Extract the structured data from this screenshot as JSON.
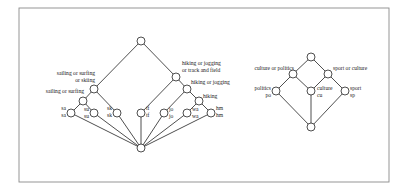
{
  "frame": {
    "x": 19,
    "y": 8,
    "w": 370,
    "h": 174,
    "border_color": "#8a8a8a"
  },
  "colors": {
    "line": "#222222",
    "node_fill": "#ffffff",
    "node_stroke": "#222222"
  },
  "node_radius": 4,
  "lattices": [
    {
      "name": "sport-lattice",
      "nodes": [
        {
          "id": "top",
          "x": 141,
          "y": 41
        },
        {
          "id": "sos-ski",
          "x": 94,
          "y": 89
        },
        {
          "id": "sos",
          "x": 83,
          "y": 101
        },
        {
          "id": "sa",
          "x": 71,
          "y": 113
        },
        {
          "id": "su",
          "x": 94,
          "y": 113
        },
        {
          "id": "sk",
          "x": 117,
          "y": 113
        },
        {
          "id": "hj-tf",
          "x": 176,
          "y": 77
        },
        {
          "id": "hj",
          "x": 187,
          "y": 89
        },
        {
          "id": "hi",
          "x": 199,
          "y": 101
        },
        {
          "id": "tf",
          "x": 141,
          "y": 113
        },
        {
          "id": "jo",
          "x": 164,
          "y": 113
        },
        {
          "id": "wa",
          "x": 187,
          "y": 113
        },
        {
          "id": "hm",
          "x": 211,
          "y": 113
        },
        {
          "id": "bottom",
          "x": 141,
          "y": 148
        }
      ],
      "edges": [
        [
          "top",
          "sos-ski"
        ],
        [
          "top",
          "hj-tf"
        ],
        [
          "sos-ski",
          "sos"
        ],
        [
          "sos-ski",
          "sk"
        ],
        [
          "sos",
          "sa"
        ],
        [
          "sos",
          "su"
        ],
        [
          "hj-tf",
          "hj"
        ],
        [
          "hj-tf",
          "tf"
        ],
        [
          "hj",
          "hi"
        ],
        [
          "hj",
          "jo"
        ],
        [
          "hi",
          "wa"
        ],
        [
          "hi",
          "hm"
        ],
        [
          "sa",
          "bottom"
        ],
        [
          "su",
          "bottom"
        ],
        [
          "sk",
          "bottom"
        ],
        [
          "tf",
          "bottom"
        ],
        [
          "jo",
          "bottom"
        ],
        [
          "wa",
          "bottom"
        ],
        [
          "hm",
          "bottom"
        ]
      ],
      "labels": [
        {
          "text": "sailing or surfing",
          "x": 95,
          "y": 75,
          "anchor": "end"
        },
        {
          "text": "or skiing",
          "x": 95,
          "y": 82,
          "anchor": "end"
        },
        {
          "text": "sailing or surfing",
          "x": 84,
          "y": 93,
          "anchor": "end"
        },
        {
          "text": "sa",
          "x": 66,
          "y": 110,
          "anchor": "end"
        },
        {
          "text": "sa",
          "x": 66,
          "y": 117,
          "anchor": "end"
        },
        {
          "text": "su",
          "x": 89,
          "y": 111,
          "anchor": "end"
        },
        {
          "text": "su",
          "x": 89,
          "y": 118,
          "anchor": "end"
        },
        {
          "text": "sk",
          "x": 112,
          "y": 110,
          "anchor": "end"
        },
        {
          "text": "sk",
          "x": 112,
          "y": 117,
          "anchor": "end"
        },
        {
          "text": "hiking or jogging",
          "x": 182,
          "y": 65,
          "anchor": "start"
        },
        {
          "text": "or track and field",
          "x": 182,
          "y": 72,
          "anchor": "start"
        },
        {
          "text": "hiking or jogging",
          "x": 191,
          "y": 84,
          "anchor": "start"
        },
        {
          "text": "hiking",
          "x": 203,
          "y": 98,
          "anchor": "start"
        },
        {
          "text": "tf",
          "x": 146,
          "y": 110,
          "anchor": "start"
        },
        {
          "text": "tf",
          "x": 146,
          "y": 117,
          "anchor": "start"
        },
        {
          "text": "jo",
          "x": 169,
          "y": 111,
          "anchor": "start"
        },
        {
          "text": "jo",
          "x": 169,
          "y": 118,
          "anchor": "start"
        },
        {
          "text": "wa",
          "x": 192,
          "y": 111,
          "anchor": "start"
        },
        {
          "text": "wa",
          "x": 192,
          "y": 118,
          "anchor": "start"
        },
        {
          "text": "hm",
          "x": 216,
          "y": 110,
          "anchor": "start"
        },
        {
          "text": "hm",
          "x": 216,
          "y": 117,
          "anchor": "start"
        }
      ]
    },
    {
      "name": "topic-lattice",
      "nodes": [
        {
          "id": "top",
          "x": 311,
          "y": 57
        },
        {
          "id": "cop",
          "x": 293,
          "y": 74
        },
        {
          "id": "soc",
          "x": 328,
          "y": 74
        },
        {
          "id": "po",
          "x": 276,
          "y": 91
        },
        {
          "id": "cu",
          "x": 311,
          "y": 91
        },
        {
          "id": "sp",
          "x": 345,
          "y": 91
        },
        {
          "id": "bottom",
          "x": 311,
          "y": 127
        }
      ],
      "edges": [
        [
          "top",
          "cop"
        ],
        [
          "top",
          "soc"
        ],
        [
          "cop",
          "po"
        ],
        [
          "cop",
          "cu"
        ],
        [
          "soc",
          "cu"
        ],
        [
          "soc",
          "sp"
        ],
        [
          "po",
          "bottom"
        ],
        [
          "cu",
          "bottom"
        ],
        [
          "sp",
          "bottom"
        ]
      ],
      "labels": [
        {
          "text": "culture or politics",
          "x": 294,
          "y": 70,
          "anchor": "end"
        },
        {
          "text": "sport or culture",
          "x": 333,
          "y": 70,
          "anchor": "start"
        },
        {
          "text": "politics",
          "x": 271,
          "y": 90,
          "anchor": "end"
        },
        {
          "text": "po",
          "x": 271,
          "y": 97,
          "anchor": "end"
        },
        {
          "text": "culture",
          "x": 317,
          "y": 90,
          "anchor": "start"
        },
        {
          "text": "cu",
          "x": 317,
          "y": 97,
          "anchor": "start"
        },
        {
          "text": "sport",
          "x": 350,
          "y": 90,
          "anchor": "start"
        },
        {
          "text": "sp",
          "x": 350,
          "y": 97,
          "anchor": "start"
        }
      ]
    }
  ]
}
